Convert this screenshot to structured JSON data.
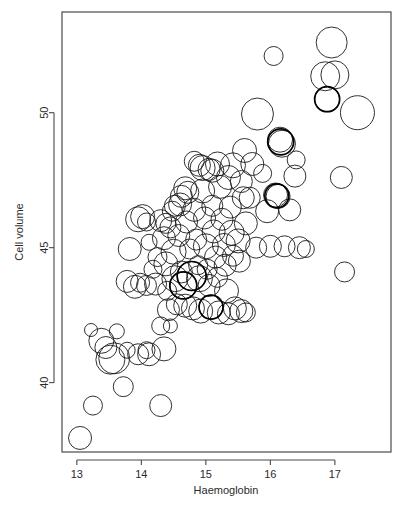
{
  "figure": {
    "width": 409,
    "height": 508,
    "background": "#ffffff",
    "stroke_color": "#1a1a1a",
    "frame_color": "#4a4a4a"
  },
  "chart_data": {
    "type": "scatter",
    "variant": "bubble",
    "title": "",
    "subtitle": "",
    "xlabel": "Haemoglobin",
    "ylabel": "Cell volume",
    "xticks": [
      13,
      14,
      15,
      16,
      17
    ],
    "xtick_labels": [
      "13",
      "14",
      "15",
      "16",
      "17"
    ],
    "yticks": [
      40,
      45,
      50
    ],
    "ytick_labels": [
      "40",
      "45",
      "50"
    ],
    "xlim": [
      12.77,
      17.87
    ],
    "ylim": [
      37.43,
      53.73
    ],
    "grid": false,
    "legend": null,
    "marker": "open-circle",
    "size_encoding": "bubble radius encodes a third variable",
    "n_points": 122,
    "points": [
      {
        "x": 13.05,
        "y": 37.95,
        "r": 11.5
      },
      {
        "x": 13.25,
        "y": 39.15,
        "r": 9.5
      },
      {
        "x": 13.22,
        "y": 41.95,
        "r": 6.5
      },
      {
        "x": 13.38,
        "y": 41.55,
        "r": 12.5
      },
      {
        "x": 13.45,
        "y": 41.3,
        "r": 11.0
      },
      {
        "x": 13.52,
        "y": 40.85,
        "r": 14.5
      },
      {
        "x": 13.58,
        "y": 40.9,
        "r": 15.5
      },
      {
        "x": 13.62,
        "y": 41.9,
        "r": 7.5
      },
      {
        "x": 13.72,
        "y": 39.85,
        "r": 10.0
      },
      {
        "x": 13.78,
        "y": 41.2,
        "r": 8.0
      },
      {
        "x": 13.95,
        "y": 41.05,
        "r": 10.5
      },
      {
        "x": 14.08,
        "y": 41.2,
        "r": 8.5
      },
      {
        "x": 14.12,
        "y": 41.05,
        "r": 11.5
      },
      {
        "x": 14.3,
        "y": 39.15,
        "r": 11.0
      },
      {
        "x": 14.35,
        "y": 41.25,
        "r": 12.0
      },
      {
        "x": 14.45,
        "y": 42.1,
        "r": 7.0
      },
      {
        "x": 13.82,
        "y": 44.95,
        "r": 11.5
      },
      {
        "x": 13.78,
        "y": 43.75,
        "r": 11.0
      },
      {
        "x": 13.9,
        "y": 43.55,
        "r": 11.5
      },
      {
        "x": 13.95,
        "y": 46.05,
        "r": 12.5
      },
      {
        "x": 14.02,
        "y": 46.15,
        "r": 12.0
      },
      {
        "x": 14.08,
        "y": 45.95,
        "r": 9.0
      },
      {
        "x": 14.12,
        "y": 45.2,
        "r": 8.0
      },
      {
        "x": 14.18,
        "y": 44.2,
        "r": 9.0
      },
      {
        "x": 14.22,
        "y": 43.65,
        "r": 11.0
      },
      {
        "x": 14.25,
        "y": 44.65,
        "r": 9.5
      },
      {
        "x": 14.3,
        "y": 46.0,
        "r": 11.0
      },
      {
        "x": 14.35,
        "y": 45.35,
        "r": 11.5
      },
      {
        "x": 14.38,
        "y": 44.4,
        "r": 12.0
      },
      {
        "x": 14.4,
        "y": 43.4,
        "r": 9.5
      },
      {
        "x": 14.42,
        "y": 42.7,
        "r": 11.0
      },
      {
        "x": 14.45,
        "y": 45.75,
        "r": 10.5
      },
      {
        "x": 14.48,
        "y": 46.35,
        "r": 10.0
      },
      {
        "x": 14.5,
        "y": 44.85,
        "r": 12.5
      },
      {
        "x": 14.52,
        "y": 43.85,
        "r": 13.0
      },
      {
        "x": 14.55,
        "y": 42.9,
        "r": 10.5
      },
      {
        "x": 14.58,
        "y": 45.45,
        "r": 11.0
      },
      {
        "x": 14.6,
        "y": 46.6,
        "r": 11.5
      },
      {
        "x": 14.62,
        "y": 44.1,
        "r": 11.0
      },
      {
        "x": 14.65,
        "y": 43.6,
        "r": 13.5
      },
      {
        "x": 14.68,
        "y": 42.85,
        "r": 11.5
      },
      {
        "x": 14.7,
        "y": 45.95,
        "r": 11.0
      },
      {
        "x": 14.72,
        "y": 47.05,
        "r": 11.0
      },
      {
        "x": 14.75,
        "y": 44.95,
        "r": 10.0
      },
      {
        "x": 14.78,
        "y": 43.95,
        "r": 14.5
      },
      {
        "x": 14.8,
        "y": 42.75,
        "r": 11.5
      },
      {
        "x": 14.82,
        "y": 46.4,
        "r": 11.5
      },
      {
        "x": 14.85,
        "y": 45.3,
        "r": 10.5
      },
      {
        "x": 14.88,
        "y": 44.35,
        "r": 9.5
      },
      {
        "x": 14.9,
        "y": 43.85,
        "r": 13.0
      },
      {
        "x": 14.92,
        "y": 42.65,
        "r": 12.0
      },
      {
        "x": 14.95,
        "y": 47.1,
        "r": 12.0
      },
      {
        "x": 14.98,
        "y": 46.1,
        "r": 11.0
      },
      {
        "x": 15.0,
        "y": 45.05,
        "r": 12.5
      },
      {
        "x": 15.02,
        "y": 44.2,
        "r": 10.0
      },
      {
        "x": 15.05,
        "y": 43.6,
        "r": 11.0
      },
      {
        "x": 15.08,
        "y": 42.8,
        "r": 12.0
      },
      {
        "x": 15.1,
        "y": 46.55,
        "r": 10.5
      },
      {
        "x": 15.12,
        "y": 45.6,
        "r": 11.5
      },
      {
        "x": 15.15,
        "y": 44.65,
        "r": 11.0
      },
      {
        "x": 15.18,
        "y": 43.9,
        "r": 10.0
      },
      {
        "x": 15.2,
        "y": 42.6,
        "r": 11.5
      },
      {
        "x": 15.22,
        "y": 47.25,
        "r": 11.5
      },
      {
        "x": 15.25,
        "y": 46.05,
        "r": 11.0
      },
      {
        "x": 15.28,
        "y": 45.1,
        "r": 11.5
      },
      {
        "x": 15.3,
        "y": 44.35,
        "r": 11.0
      },
      {
        "x": 15.32,
        "y": 43.4,
        "r": 12.0
      },
      {
        "x": 15.35,
        "y": 42.55,
        "r": 11.0
      },
      {
        "x": 15.38,
        "y": 46.5,
        "r": 11.0
      },
      {
        "x": 15.4,
        "y": 45.55,
        "r": 12.5
      },
      {
        "x": 15.42,
        "y": 44.7,
        "r": 10.5
      },
      {
        "x": 15.45,
        "y": 42.75,
        "r": 11.5
      },
      {
        "x": 15.5,
        "y": 45.25,
        "r": 12.0
      },
      {
        "x": 15.52,
        "y": 44.5,
        "r": 11.0
      },
      {
        "x": 15.55,
        "y": 42.65,
        "r": 11.5
      },
      {
        "x": 15.58,
        "y": 46.85,
        "r": 11.0
      },
      {
        "x": 14.9,
        "y": 48.05,
        "r": 11.0
      },
      {
        "x": 14.95,
        "y": 47.95,
        "r": 12.5
      },
      {
        "x": 15.1,
        "y": 47.85,
        "r": 11.5
      },
      {
        "x": 15.35,
        "y": 47.6,
        "r": 12.0
      },
      {
        "x": 15.42,
        "y": 48.05,
        "r": 12.5
      },
      {
        "x": 15.55,
        "y": 47.45,
        "r": 11.0
      },
      {
        "x": 15.62,
        "y": 45.9,
        "r": 11.5
      },
      {
        "x": 15.68,
        "y": 46.85,
        "r": 10.5
      },
      {
        "x": 14.82,
        "y": 48.2,
        "r": 10.0
      },
      {
        "x": 14.62,
        "y": 46.9,
        "r": 11.0
      },
      {
        "x": 14.3,
        "y": 42.1,
        "r": 9.0
      },
      {
        "x": 15.6,
        "y": 48.6,
        "r": 12.0
      },
      {
        "x": 15.72,
        "y": 48.1,
        "r": 11.5
      },
      {
        "x": 15.8,
        "y": 49.95,
        "r": 16.0
      },
      {
        "x": 15.88,
        "y": 47.75,
        "r": 9.0
      },
      {
        "x": 15.95,
        "y": 46.35,
        "r": 11.5
      },
      {
        "x": 16.0,
        "y": 45.05,
        "r": 11.0
      },
      {
        "x": 16.05,
        "y": 52.1,
        "r": 9.5
      },
      {
        "x": 16.08,
        "y": 46.95,
        "r": 12.0
      },
      {
        "x": 16.12,
        "y": 46.9,
        "r": 12.0
      },
      {
        "x": 16.15,
        "y": 49.0,
        "r": 12.5
      },
      {
        "x": 16.18,
        "y": 48.85,
        "r": 13.5
      },
      {
        "x": 16.22,
        "y": 45.05,
        "r": 10.5
      },
      {
        "x": 16.3,
        "y": 46.4,
        "r": 11.0
      },
      {
        "x": 16.38,
        "y": 47.65,
        "r": 11.0
      },
      {
        "x": 16.45,
        "y": 45.0,
        "r": 11.0
      },
      {
        "x": 16.55,
        "y": 44.95,
        "r": 8.5
      },
      {
        "x": 16.85,
        "y": 51.35,
        "r": 14.5
      },
      {
        "x": 16.88,
        "y": 50.5,
        "r": 12.5
      },
      {
        "x": 16.95,
        "y": 52.6,
        "r": 15.5
      },
      {
        "x": 17.0,
        "y": 51.4,
        "r": 14.0
      },
      {
        "x": 17.1,
        "y": 47.6,
        "r": 11.0
      },
      {
        "x": 17.15,
        "y": 44.1,
        "r": 10.0
      },
      {
        "x": 17.35,
        "y": 50.0,
        "r": 17.0
      },
      {
        "x": 16.4,
        "y": 48.25,
        "r": 9.0
      },
      {
        "x": 15.78,
        "y": 45.0,
        "r": 10.5
      },
      {
        "x": 15.18,
        "y": 48.1,
        "r": 12.0
      },
      {
        "x": 14.52,
        "y": 46.55,
        "r": 10.5
      },
      {
        "x": 14.38,
        "y": 45.9,
        "r": 10.0
      },
      {
        "x": 14.08,
        "y": 43.6,
        "r": 10.0
      },
      {
        "x": 13.98,
        "y": 43.7,
        "r": 9.5
      },
      {
        "x": 14.68,
        "y": 47.2,
        "r": 11.5
      },
      {
        "x": 15.62,
        "y": 42.6,
        "r": 9.5
      },
      {
        "x": 15.05,
        "y": 47.9,
        "r": 11.0
      }
    ],
    "bold_points": [
      {
        "x": 14.78,
        "y": 43.95,
        "r": 14.5
      },
      {
        "x": 14.65,
        "y": 43.6,
        "r": 13.5
      },
      {
        "x": 16.88,
        "y": 50.5,
        "r": 12.5
      },
      {
        "x": 16.1,
        "y": 46.92,
        "r": 12.0
      },
      {
        "x": 15.08,
        "y": 42.8,
        "r": 12.0
      },
      {
        "x": 16.16,
        "y": 48.92,
        "r": 13.0
      }
    ]
  }
}
